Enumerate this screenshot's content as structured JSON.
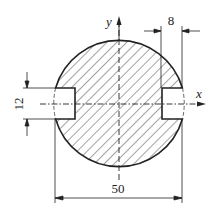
{
  "figure": {
    "type": "engineering-cross-section",
    "axes": {
      "x_label": "x",
      "y_label": "y"
    },
    "dimensions": {
      "slot_height": "12",
      "slot_depth": "8",
      "diameter": "50"
    },
    "colors": {
      "line": "#222222",
      "background": "#ffffff"
    }
  }
}
